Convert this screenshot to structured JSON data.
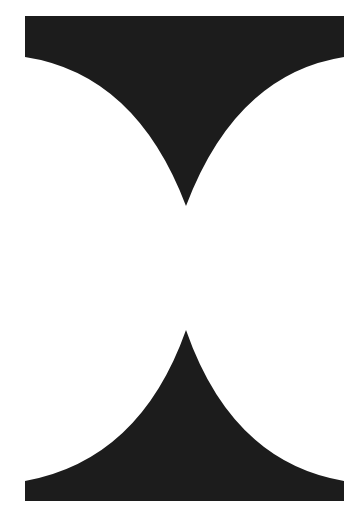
{
  "canvas": {
    "width": 358,
    "height": 517,
    "background": "#ffffff"
  },
  "shapes": {
    "fill": "#1c1c1c",
    "top": {
      "name": "top-cusp-shape",
      "path": "M25,16 L344,16 L344,57 Q236,74 186,206 Q136,74 25,57 Z"
    },
    "bottom": {
      "name": "bottom-cusp-shape",
      "path": "M25,501 L344,501 L344,481 Q232,462 186,330 Q140,460 25,481 Z"
    }
  }
}
